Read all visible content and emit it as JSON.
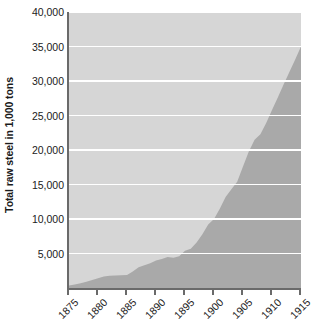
{
  "chart_data": {
    "type": "area",
    "title": "",
    "xlabel": "",
    "ylabel": "Total raw steel in 1,000 tons",
    "x": [
      1875,
      1876,
      1877,
      1878,
      1879,
      1880,
      1881,
      1882,
      1883,
      1884,
      1885,
      1886,
      1887,
      1888,
      1889,
      1890,
      1891,
      1892,
      1893,
      1894,
      1895,
      1896,
      1897,
      1898,
      1899,
      1900,
      1901,
      1902,
      1903,
      1904,
      1905,
      1906,
      1907,
      1908,
      1909,
      1910,
      1911,
      1912,
      1913,
      1914,
      1915
    ],
    "values": [
      380,
      500,
      620,
      780,
      1000,
      1270,
      1600,
      1800,
      1720,
      1600,
      1750,
      2600,
      3350,
      3200,
      3400,
      4300,
      3900,
      4900,
      4000,
      4400,
      6200,
      5300,
      7200,
      8900,
      10600,
      10200,
      13500,
      15200,
      14500,
      13900,
      20000,
      23400,
      23400,
      14000,
      24000,
      26100,
      24000,
      31300,
      31300,
      23500,
      35000
    ],
    "series": [
      {
        "name": "Total raw steel",
        "values": [
          380,
          500,
          620,
          780,
          1000,
          1270,
          1600,
          1800,
          1720,
          1600,
          1750,
          2600,
          3350,
          3200,
          3400,
          4300,
          3900,
          4900,
          4000,
          4400,
          6200,
          5300,
          7200,
          8900,
          10600,
          10200,
          13500,
          15200,
          14500,
          13900,
          20000,
          23400,
          23400,
          14000,
          24000,
          26100,
          24000,
          31300,
          31300,
          23500,
          35000
        ]
      }
    ],
    "smoothed_values": [
      380,
      520,
      700,
      900,
      1150,
      1400,
      1650,
      1780,
      1800,
      1830,
      1900,
      2400,
      3000,
      3300,
      3600,
      4000,
      4200,
      4500,
      4400,
      4600,
      5400,
      5700,
      6600,
      7800,
      9200,
      10000,
      11500,
      13200,
      14300,
      15400,
      17600,
      19800,
      21500,
      22300,
      23900,
      25800,
      27600,
      29500,
      31300,
      33100,
      35000
    ],
    "y_ticks": [
      0,
      5000,
      10000,
      15000,
      20000,
      25000,
      30000,
      35000,
      40000
    ],
    "y_tick_labels": [
      "",
      "5,000",
      "10,000",
      "15,000",
      "20,000",
      "25,000",
      "30,000",
      "35,000",
      "40,000"
    ],
    "x_ticks": [
      1875,
      1880,
      1885,
      1890,
      1895,
      1900,
      1905,
      1910,
      1915
    ],
    "x_tick_labels": [
      "1875",
      "1880",
      "1885",
      "1890",
      "1895",
      "1900",
      "1905",
      "1910",
      "1915"
    ],
    "ylim": [
      0,
      40000
    ],
    "xlim": [
      1875,
      1915
    ],
    "grid": true,
    "legend": "none",
    "colors": {
      "plot_background": "#d6d6d6",
      "area_fill": "#a9a9a9",
      "gridline": "#ffffff",
      "axis": "#6a6a6a",
      "text": "#1b1b1b",
      "page_background": "#ffffff"
    }
  }
}
